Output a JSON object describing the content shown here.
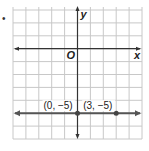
{
  "item_marker": "•",
  "chart_data": {
    "type": "line",
    "title": "",
    "xlabel": "x",
    "ylabel": "y",
    "origin_label": "O",
    "xlim": [
      -5,
      5
    ],
    "ylim": [
      -7,
      3
    ],
    "grid": true,
    "series": [
      {
        "name": "y = -5",
        "x": [
          0,
          3
        ],
        "y": [
          -5,
          -5
        ]
      }
    ],
    "points": [
      {
        "x": 0,
        "y": -5,
        "label": "(0, −5)"
      },
      {
        "x": 3,
        "y": -5,
        "label": "(3, −5)"
      }
    ]
  },
  "colors": {
    "grid": "#c8c8c8",
    "axis": "#333333",
    "line": "#555555"
  }
}
